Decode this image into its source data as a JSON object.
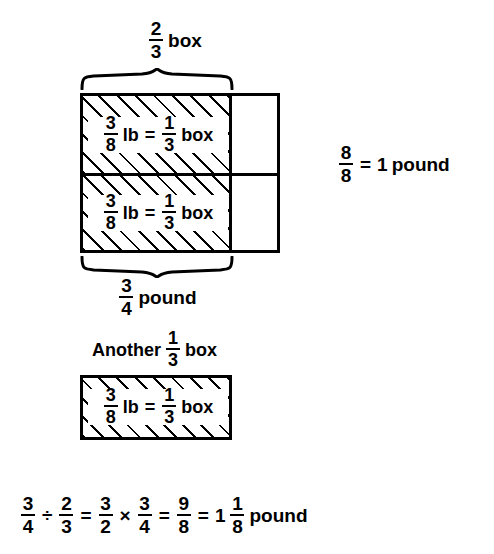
{
  "figure": {
    "title_top": {
      "fraction": {
        "num": "2",
        "den": "3"
      },
      "word": "box"
    },
    "bottom_brace_label": {
      "fraction": {
        "num": "3",
        "den": "4"
      },
      "word": "pound"
    },
    "right_note": {
      "fraction": {
        "num": "8",
        "den": "8"
      },
      "equals": "=",
      "value": "1",
      "unit": "pound"
    },
    "another_label": {
      "prefix": "Another",
      "fraction": {
        "num": "1",
        "den": "3"
      },
      "word": "box"
    },
    "cell_label": {
      "weight": {
        "num": "3",
        "den": "8"
      },
      "weight_unit": "lb",
      "equals": "=",
      "portion": {
        "num": "1",
        "den": "3"
      },
      "portion_unit": "box"
    },
    "cells": [
      {
        "name": "upper-cell",
        "weight": {
          "num": "3",
          "den": "8"
        },
        "weight_unit": "lb",
        "equals": "=",
        "portion": {
          "num": "1",
          "den": "3"
        },
        "portion_unit": "box"
      },
      {
        "name": "lower-cell",
        "weight": {
          "num": "3",
          "den": "8"
        },
        "weight_unit": "lb",
        "equals": "=",
        "portion": {
          "num": "1",
          "den": "3"
        },
        "portion_unit": "box"
      }
    ],
    "equation": {
      "a": {
        "num": "3",
        "den": "4"
      },
      "op1": "÷",
      "b": {
        "num": "2",
        "den": "3"
      },
      "eq1": "=",
      "c": {
        "num": "3",
        "den": "2"
      },
      "op2": "×",
      "d": {
        "num": "3",
        "den": "4"
      },
      "eq2": "=",
      "e": {
        "num": "9",
        "den": "8"
      },
      "eq3": "=",
      "whole": "1",
      "f": {
        "num": "1",
        "den": "8"
      },
      "unit": "pound"
    }
  },
  "colors": {
    "ink": "#000000",
    "paper": "#ffffff"
  }
}
